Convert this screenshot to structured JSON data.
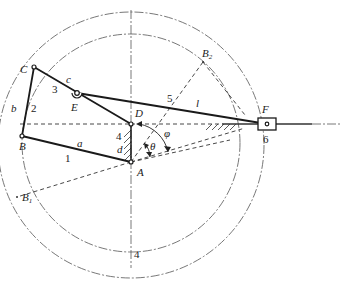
{
  "figure": {
    "type": "six-bar linkage mechanism diagram (crank-rocker with slider)",
    "points": {
      "A": "A",
      "B": "B",
      "B1": "B",
      "B1_sub": "1",
      "B2": "B",
      "B2_sub": "2",
      "C": "C",
      "D": "D",
      "E": "E",
      "F": "F"
    },
    "links": {
      "a": "a",
      "b": "b",
      "c": "c",
      "d": "d",
      "l": "l"
    },
    "members": {
      "m1": "1",
      "m2": "2",
      "m3": "3",
      "m4_frame_top": "4",
      "m4_frame_bottom": "4",
      "m5": "5",
      "m6": "6"
    },
    "angles": {
      "phi": "φ",
      "theta": "θ"
    },
    "colors": {
      "line": "#1a1a1a",
      "construction": "#555555",
      "background": "#ffffff"
    }
  }
}
